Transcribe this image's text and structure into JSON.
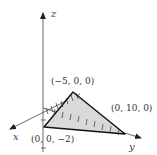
{
  "diagram": {
    "type": "3d-coordinate-plane-trace",
    "axes": {
      "x": {
        "label": "x"
      },
      "y": {
        "label": "y"
      },
      "z": {
        "label": "z"
      }
    },
    "points": [
      {
        "label": "(−5, 0, 0)",
        "coords": [
          -5,
          0,
          0
        ]
      },
      {
        "label": "(0, 10, 0)",
        "coords": [
          0,
          10,
          0
        ]
      },
      {
        "label": "(0, 0, −2)",
        "coords": [
          0,
          0,
          -2
        ]
      }
    ],
    "shading": "#d9d9d9",
    "edge_color": "#111111",
    "axis_color": "#555555"
  }
}
